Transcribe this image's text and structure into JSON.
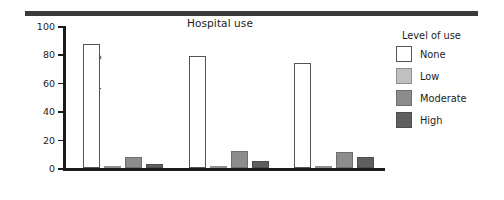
{
  "chart_data": {
    "type": "bar",
    "title": "Hospital use",
    "xlabel": "",
    "ylabel": "Percent reporting",
    "ylim": [
      0,
      100
    ],
    "yticks": [
      0,
      20,
      40,
      60,
      80,
      100
    ],
    "grid": false,
    "legend_position": "right",
    "legend_title": "Level of use",
    "categories": [
      "55–64 years",
      "65–74 years",
      "75 years and over"
    ],
    "series": [
      {
        "name": "None",
        "color": "#ffffff",
        "values": [
          87,
          79,
          74
        ]
      },
      {
        "name": "Low",
        "color": "#c0c0c0",
        "values": [
          1.5,
          1.5,
          1.5
        ]
      },
      {
        "name": "Moderate",
        "color": "#8c8c8c",
        "values": [
          8,
          12,
          11
        ]
      },
      {
        "name": "High",
        "color": "#5f5f5f",
        "values": [
          2.5,
          5,
          8
        ]
      }
    ]
  },
  "figure": {
    "top_rule_color": "#3a3a3a",
    "axis_color": "#1c1c1c",
    "background": "#ffffff"
  }
}
